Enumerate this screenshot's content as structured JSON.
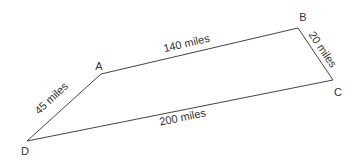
{
  "diagram": {
    "type": "quadrilateral-route-map",
    "line_color": "#444444",
    "text_color": "#333333",
    "vertices": [
      {
        "id": "A",
        "label": "A",
        "x": 101,
        "y": 74,
        "label_x": 99,
        "label_y": 66
      },
      {
        "id": "B",
        "label": "B",
        "x": 298,
        "y": 28,
        "label_x": 303,
        "label_y": 17
      },
      {
        "id": "C",
        "label": "C",
        "x": 333,
        "y": 80,
        "label_x": 337,
        "label_y": 92
      },
      {
        "id": "D",
        "label": "D",
        "x": 27,
        "y": 141,
        "label_x": 25,
        "label_y": 151
      }
    ],
    "edges": [
      {
        "from": "A",
        "to": "B",
        "label": "140 miles",
        "distance": 140,
        "unit": "miles"
      },
      {
        "from": "B",
        "to": "C",
        "label": "20 miles",
        "distance": 20,
        "unit": "miles"
      },
      {
        "from": "C",
        "to": "D",
        "label": "200 miles",
        "distance": 200,
        "unit": "miles"
      },
      {
        "from": "D",
        "to": "A",
        "label": "45 miles",
        "distance": 45,
        "unit": "miles"
      }
    ]
  }
}
